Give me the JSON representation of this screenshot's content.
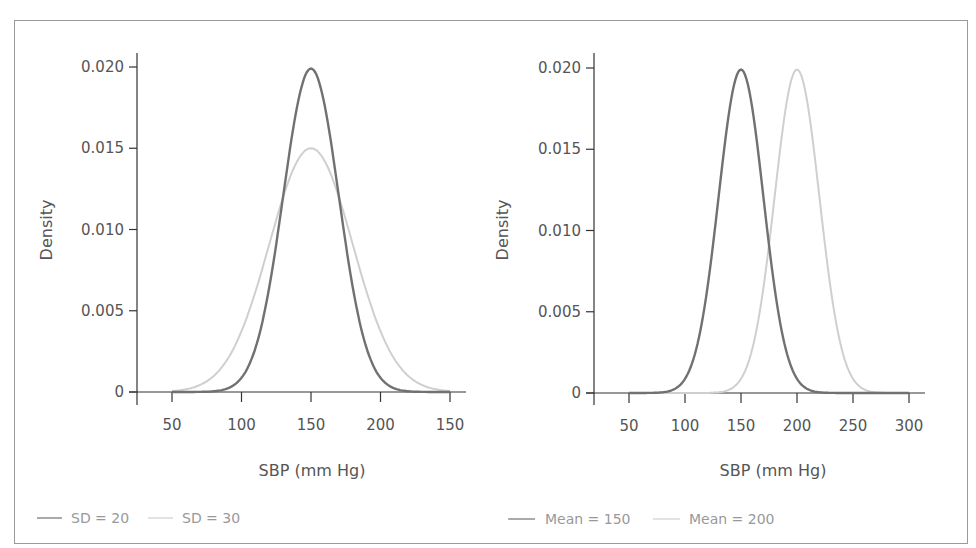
{
  "colors": {
    "dark_series": "#717171",
    "light_series": "#cfcfcf",
    "axis": "#333333",
    "frame": "#9a9a9a",
    "text": "#555555",
    "legend_text": "#999999"
  },
  "panels": [
    {
      "ylabel": "Density",
      "xlabel": "SBP (mm Hg)",
      "y_ticks": [
        "0",
        "0.005",
        "0.010",
        "0.015",
        "0.020"
      ],
      "x_ticks": [
        "50",
        "100",
        "150",
        "200",
        "150"
      ],
      "legend": [
        {
          "label": "SD = 20",
          "series": "dark"
        },
        {
          "label": "SD = 30",
          "series": "light"
        }
      ]
    },
    {
      "ylabel": "Density",
      "xlabel": "SBP (mm Hg)",
      "y_ticks": [
        "0",
        "0.005",
        "0.010",
        "0.015",
        "0.020"
      ],
      "x_ticks": [
        "50",
        "100",
        "150",
        "200",
        "250",
        "300"
      ],
      "legend": [
        {
          "label": "Mean = 150",
          "series": "dark"
        },
        {
          "label": "Mean = 200",
          "series": "light"
        }
      ]
    }
  ],
  "chart_data": [
    {
      "type": "line",
      "title": "",
      "xlabel": "SBP (mm Hg)",
      "ylabel": "Density",
      "xlim": [
        50,
        250
      ],
      "ylim": [
        0,
        0.02
      ],
      "x_tick_labels": [
        "50",
        "100",
        "150",
        "200",
        "150"
      ],
      "y_tick_labels": [
        "0",
        "0.005",
        "0.010",
        "0.015",
        "0.020"
      ],
      "grid": false,
      "legend_position": "bottom",
      "series": [
        {
          "name": "SD = 20",
          "distribution": "normal",
          "mean": 150,
          "sd": 20,
          "peak_density": 0.0199,
          "x": [
            50,
            75,
            100,
            110,
            120,
            130,
            140,
            150,
            160,
            170,
            180,
            190,
            200,
            225,
            250
          ],
          "values": [
            0.0,
            0.0,
            0.0009,
            0.0027,
            0.0065,
            0.0121,
            0.0176,
            0.0199,
            0.0176,
            0.0121,
            0.0065,
            0.0027,
            0.0009,
            0.0,
            0.0
          ]
        },
        {
          "name": "SD = 30",
          "distribution": "normal",
          "mean": 150,
          "sd": 30,
          "peak_density": 0.015,
          "x": [
            50,
            75,
            100,
            110,
            120,
            130,
            140,
            150,
            160,
            170,
            180,
            190,
            200,
            225,
            250
          ],
          "values": [
            0.0001,
            0.0007,
            0.0037,
            0.0062,
            0.0091,
            0.012,
            0.0142,
            0.015,
            0.0142,
            0.012,
            0.0091,
            0.0062,
            0.0037,
            0.0007,
            0.0001
          ]
        }
      ]
    },
    {
      "type": "line",
      "title": "",
      "xlabel": "SBP (mm Hg)",
      "ylabel": "Density",
      "xlim": [
        50,
        300
      ],
      "ylim": [
        0,
        0.02
      ],
      "x_tick_labels": [
        "50",
        "100",
        "150",
        "200",
        "250",
        "300"
      ],
      "y_tick_labels": [
        "0",
        "0.005",
        "0.010",
        "0.015",
        "0.020"
      ],
      "grid": false,
      "legend_position": "bottom",
      "series": [
        {
          "name": "Mean = 150",
          "distribution": "normal",
          "mean": 150,
          "sd": 20,
          "peak_density": 0.0199,
          "x": [
            50,
            100,
            120,
            130,
            140,
            150,
            160,
            170,
            180,
            200,
            250,
            300
          ],
          "values": [
            0.0,
            0.0009,
            0.0065,
            0.0121,
            0.0176,
            0.0199,
            0.0176,
            0.0121,
            0.0065,
            0.0009,
            0.0,
            0.0
          ]
        },
        {
          "name": "Mean = 200",
          "distribution": "normal",
          "mean": 200,
          "sd": 20,
          "peak_density": 0.0199,
          "x": [
            50,
            100,
            150,
            170,
            180,
            190,
            200,
            210,
            220,
            230,
            250,
            300
          ],
          "values": [
            0.0,
            0.0,
            0.0009,
            0.0065,
            0.0121,
            0.0176,
            0.0199,
            0.0176,
            0.0121,
            0.0065,
            0.0009,
            0.0
          ]
        }
      ]
    }
  ]
}
